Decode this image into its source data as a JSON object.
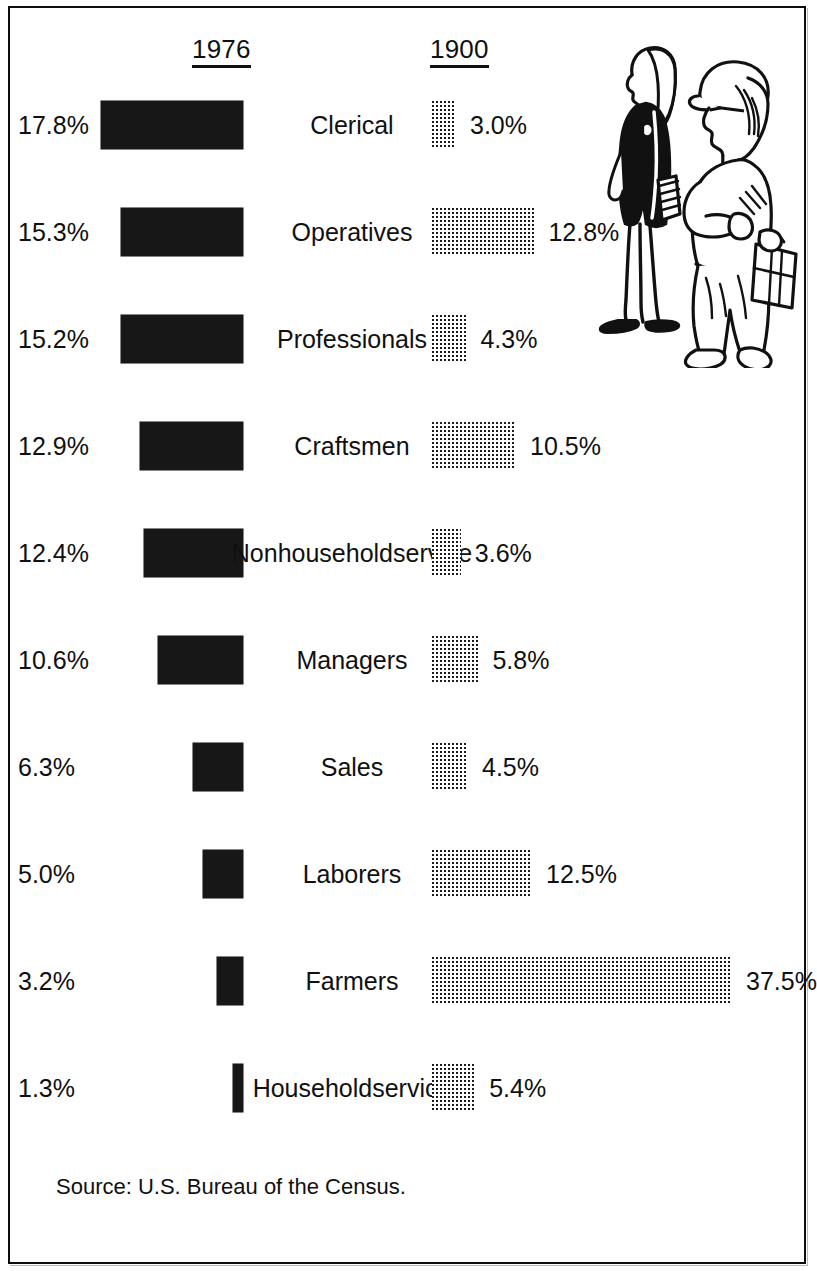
{
  "headers": {
    "left_year": "1976",
    "right_year": "1900"
  },
  "source": "Source: U.S. Bureau of the Census.",
  "illustration": {
    "name": "two-workers-illustration",
    "figures": [
      "woman-in-dark-coat",
      "construction-worker-with-lunchbox"
    ]
  },
  "colors": {
    "bar_1976": "#171717",
    "bar_1900_dots": "#1c1c1c",
    "text": "#101010",
    "frame": "#0d0d0d",
    "background": "#ffffff"
  },
  "chart_data": {
    "type": "bar",
    "title": "",
    "subtitle": "",
    "xlabel": "",
    "ylabel": "",
    "orientation": "horizontal",
    "legend_position": "top",
    "grid": false,
    "xlim": [
      0,
      37.5
    ],
    "units": "percent",
    "categories": [
      "Clerical",
      "Operatives",
      "Professionals",
      "Craftsmen",
      "Nonhousehold service",
      "Managers",
      "Sales",
      "Laborers",
      "Farmers",
      "Household service"
    ],
    "series": [
      {
        "name": "1976",
        "values": [
          17.8,
          15.3,
          15.2,
          12.9,
          12.4,
          10.6,
          6.3,
          5.0,
          3.2,
          1.3
        ],
        "labels": [
          "17.8%",
          "15.3%",
          "15.2%",
          "12.9%",
          "12.4%",
          "10.6%",
          "6.3%",
          "5.0%",
          "3.2%",
          "1.3%"
        ]
      },
      {
        "name": "1900",
        "values": [
          3.0,
          12.8,
          4.3,
          10.5,
          3.6,
          5.8,
          4.5,
          12.5,
          37.5,
          5.4
        ],
        "labels": [
          "3.0%",
          "12.8%",
          "4.3%",
          "10.5%",
          "3.6%",
          "5.8%",
          "4.5%",
          "12.5%",
          "37.5%",
          "5.4%"
        ]
      }
    ]
  },
  "rows": [
    {
      "category_line1": "Clerical",
      "category_line2": "",
      "pct_1976": "17.8%",
      "pct_1900": "3.0%",
      "v1976": 17.8,
      "v1900": 3.0
    },
    {
      "category_line1": "Operatives",
      "category_line2": "",
      "pct_1976": "15.3%",
      "pct_1900": "12.8%",
      "v1976": 15.3,
      "v1900": 12.8
    },
    {
      "category_line1": "Professionals",
      "category_line2": "",
      "pct_1976": "15.2%",
      "pct_1900": "4.3%",
      "v1976": 15.2,
      "v1900": 4.3
    },
    {
      "category_line1": "Craftsmen",
      "category_line2": "",
      "pct_1976": "12.9%",
      "pct_1900": "10.5%",
      "v1976": 12.9,
      "v1900": 10.5
    },
    {
      "category_line1": "Nonhousehold",
      "category_line2": "service",
      "pct_1976": "12.4%",
      "pct_1900": "3.6%",
      "v1976": 12.4,
      "v1900": 3.6
    },
    {
      "category_line1": "Managers",
      "category_line2": "",
      "pct_1976": "10.6%",
      "pct_1900": "5.8%",
      "v1976": 10.6,
      "v1900": 5.8
    },
    {
      "category_line1": "Sales",
      "category_line2": "",
      "pct_1976": "6.3%",
      "pct_1900": "4.5%",
      "v1976": 6.3,
      "v1900": 4.5
    },
    {
      "category_line1": "Laborers",
      "category_line2": "",
      "pct_1976": "5.0%",
      "pct_1900": "12.5%",
      "v1976": 5.0,
      "v1900": 12.5
    },
    {
      "category_line1": "Farmers",
      "category_line2": "",
      "pct_1976": "3.2%",
      "pct_1900": "37.5%",
      "v1976": 3.2,
      "v1900": 37.5
    },
    {
      "category_line1": "Household",
      "category_line2": "service",
      "pct_1976": "1.3%",
      "pct_1900": "5.4%",
      "v1976": 1.3,
      "v1900": 5.4
    }
  ]
}
